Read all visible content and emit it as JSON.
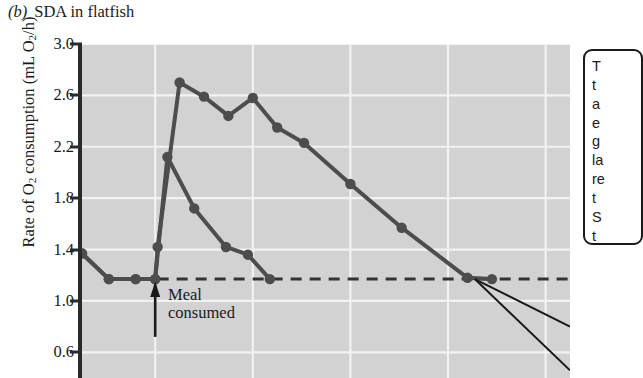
{
  "figure": {
    "panel_label": "(b)",
    "title": "SDA in flatfish",
    "y_axis_label_pre": "Rate of O",
    "y_axis_label_sub1": "2",
    "y_axis_label_mid": " consumption (mL O",
    "y_axis_label_sub2": "2",
    "y_axis_label_post": "/h)"
  },
  "annotations": {
    "meal_line1": "Meal",
    "meal_line2": "consumed",
    "arrow": "up-arrow-icon"
  },
  "callout": {
    "note": "text clipped by right edge of screenshot; only leading glyphs visible",
    "lines": [
      "T",
      "t",
      "a",
      "e",
      "g",
      "la",
      "re",
      "t",
      "S",
      "t",
      "fc"
    ]
  },
  "colors": {
    "plot_background": "#d2d2d2",
    "gridline": "#f2f2f2",
    "series": "#4d4d4d",
    "axis": "#2a2a2a",
    "page_background": "#ffffff",
    "text": "#1a1a1a"
  },
  "chart_data": {
    "type": "line",
    "xlabel": "",
    "ylabel": "Rate of O2 consumption (mL O2/h)",
    "ylim": [
      0.4,
      3.0
    ],
    "yticks": [
      3.0,
      2.6,
      2.2,
      1.8,
      1.4,
      1.0,
      0.6
    ],
    "ytick_labels": [
      "3.0",
      "2.6",
      "2.2",
      "1.8",
      "1.4",
      "1.0",
      "0.6"
    ],
    "xlim": [
      0,
      10
    ],
    "xticks": [],
    "xtick_labels": [],
    "grid": "both-axes-white-gridlines",
    "x_gridlines": [
      1.5,
      3.5,
      5.5,
      7.5,
      9.5
    ],
    "legend": "none",
    "x_note": "x axis is cropped off the bottom of the screenshot; x values are relative time units",
    "series": [
      {
        "name": "Large meal (upper curve)",
        "x": [
          0.0,
          0.55,
          1.1,
          1.5,
          1.55,
          2.0,
          2.5,
          3.0,
          3.5,
          4.0,
          4.55,
          5.5,
          6.55,
          7.9,
          8.4
        ],
        "values": [
          1.37,
          1.17,
          1.17,
          1.17,
          1.42,
          2.7,
          2.59,
          2.44,
          2.58,
          2.35,
          2.23,
          1.91,
          1.57,
          1.18,
          1.17
        ]
      },
      {
        "name": "Small meal (lower curve)",
        "x": [
          0.0,
          0.55,
          1.1,
          1.5,
          1.75,
          2.3,
          2.95,
          3.4,
          3.85
        ],
        "values": [
          1.37,
          1.17,
          1.17,
          1.17,
          2.12,
          1.72,
          1.42,
          1.36,
          1.17
        ]
      }
    ],
    "reference_line": {
      "name": "pre-meal baseline",
      "style": "dashed",
      "y": 1.17,
      "x_start": 1.55,
      "x_end": 10.0
    },
    "event_marker": {
      "label": "Meal consumed",
      "x": 1.5,
      "style": "up-arrow"
    }
  }
}
